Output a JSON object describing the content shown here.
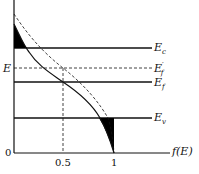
{
  "diagram": {
    "type": "fermi-dirac-distribution",
    "y_axis_label": "E",
    "x_axis_label": "f(E)",
    "origin_label": "0",
    "x_ticks": [
      "0.5",
      "1"
    ],
    "levels": [
      {
        "name": "Ec",
        "base": "E",
        "sub": "c",
        "sup": "",
        "style": "solid"
      },
      {
        "name": "Ef_prime",
        "base": "E",
        "sub": "f",
        "sup": "′",
        "style": "dashed"
      },
      {
        "name": "Ef",
        "base": "E",
        "sub": "f",
        "sup": "",
        "style": "solid"
      },
      {
        "name": "Ev",
        "base": "E",
        "sub": "v",
        "sup": "",
        "style": "solid"
      }
    ],
    "curves": [
      {
        "name": "f(E) at Ef",
        "style": "solid"
      },
      {
        "name": "f(E) at Ef'",
        "style": "dashed"
      }
    ],
    "shaded_regions": [
      "electrons above Ec",
      "holes below Ev"
    ]
  }
}
